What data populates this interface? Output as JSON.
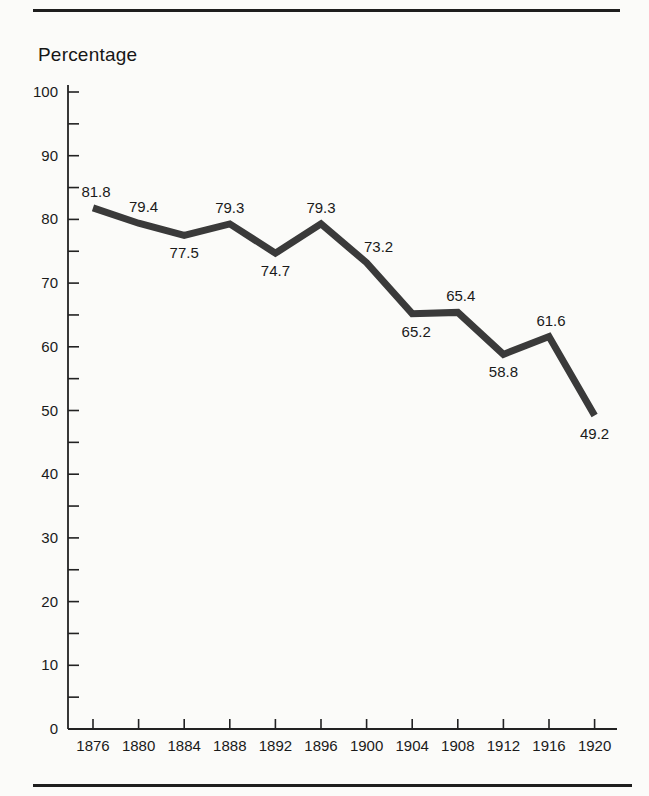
{
  "page": {
    "background_color": "#fbfbf9",
    "rule_color": "#1e1e1e"
  },
  "chart_data": {
    "type": "line",
    "ylabel": "Percentage",
    "xlabel": "",
    "title": "",
    "x": [
      1876,
      1880,
      1884,
      1888,
      1892,
      1896,
      1900,
      1904,
      1908,
      1912,
      1916,
      1920
    ],
    "values": [
      81.8,
      79.4,
      77.5,
      79.3,
      74.7,
      79.3,
      73.2,
      65.2,
      65.4,
      58.8,
      61.6,
      49.2
    ],
    "data_labels": [
      "81.8",
      "79.4",
      "77.5",
      "79.3",
      "74.7",
      "79.3",
      "73.2",
      "65.2",
      "65.4",
      "58.8",
      "61.6",
      "49.2"
    ],
    "ylim": [
      0,
      100
    ],
    "y_major_step": 10,
    "y_minor_step": 5,
    "y_tick_labels": [
      "0",
      "10",
      "20",
      "30",
      "40",
      "50",
      "60",
      "70",
      "80",
      "90",
      "100"
    ],
    "grid": false,
    "legend_position": "none",
    "line_color": "#3a3a3a",
    "axis_color": "#222222",
    "text_color": "#1a1a1a",
    "label_positions": [
      "above",
      "above",
      "below",
      "above",
      "below",
      "above",
      "above",
      "below",
      "above",
      "below",
      "above",
      "below"
    ],
    "label_dx": [
      3,
      5,
      0,
      0,
      0,
      0,
      12,
      4,
      3,
      0,
      2,
      0
    ]
  }
}
